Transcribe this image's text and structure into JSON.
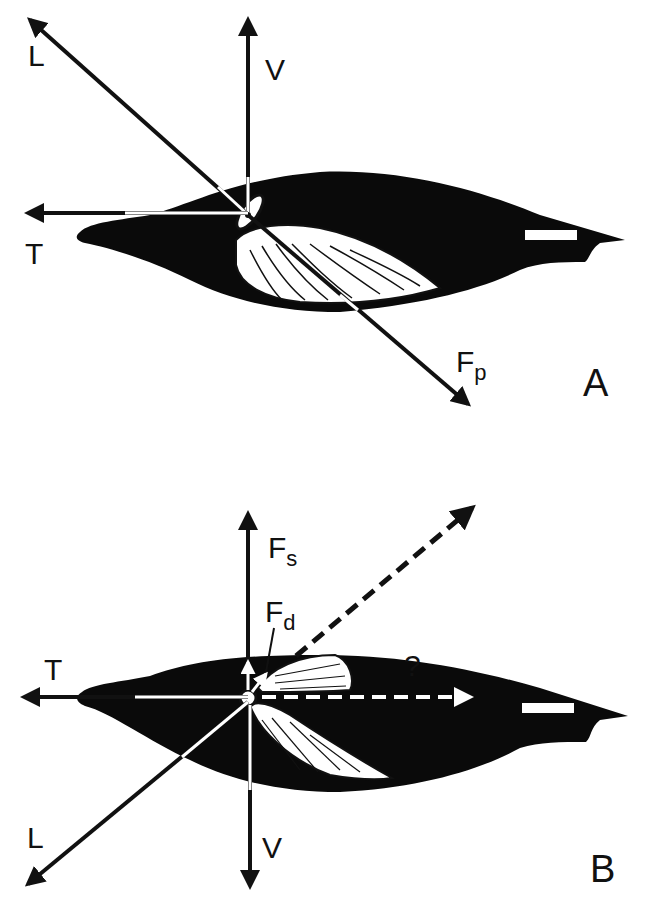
{
  "figure": {
    "panels": [
      {
        "id": "A",
        "panel_label": "A",
        "vectors": [
          {
            "label": "L",
            "sub": "",
            "style": "solid",
            "direction": "up-left"
          },
          {
            "label": "V",
            "sub": "",
            "style": "solid",
            "direction": "up"
          },
          {
            "label": "T",
            "sub": "",
            "style": "solid",
            "direction": "left"
          },
          {
            "label": "F",
            "sub": "p",
            "style": "solid",
            "direction": "down-right"
          }
        ],
        "subject": "swimming bird silhouette (side view, wing downstroke)"
      },
      {
        "id": "B",
        "panel_label": "B",
        "vectors": [
          {
            "label": "F",
            "sub": "s",
            "style": "solid",
            "direction": "up"
          },
          {
            "label": "F",
            "sub": "d",
            "style": "solid",
            "direction": "up (short)"
          },
          {
            "label": "T",
            "sub": "",
            "style": "solid",
            "direction": "left"
          },
          {
            "label": "L",
            "sub": "",
            "style": "solid",
            "direction": "down-left"
          },
          {
            "label": "V",
            "sub": "",
            "style": "solid",
            "direction": "down"
          },
          {
            "label": "",
            "sub": "",
            "style": "dashed",
            "direction": "up-right"
          },
          {
            "label": "?",
            "sub": "",
            "style": "dashed-white",
            "direction": "right"
          }
        ],
        "subject": "swimming bird silhouette (side view, wing upstroke)"
      }
    ]
  }
}
